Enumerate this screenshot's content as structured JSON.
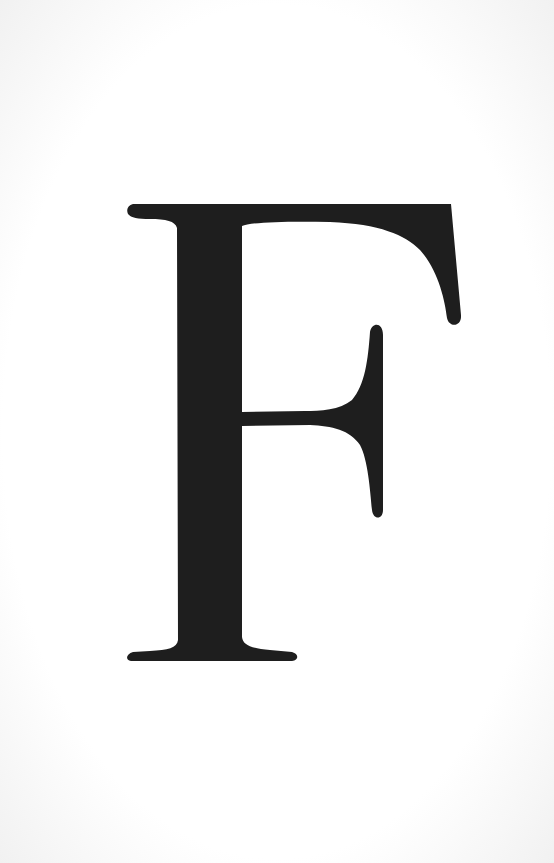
{
  "letter": {
    "character": "F",
    "color": "#1e1e1e",
    "background": "#ffffff"
  }
}
